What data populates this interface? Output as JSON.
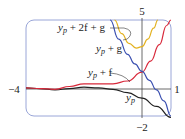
{
  "chart_data": {
    "type": "line",
    "title": "",
    "xlabel": "",
    "ylabel": "",
    "xlim": [
      -4,
      1
    ],
    "ylim": [
      -2,
      5
    ],
    "tick_labels": {
      "top": "5",
      "bottom": "−2",
      "left": "−4",
      "right": "1"
    },
    "grid": false,
    "series": [
      {
        "name": "y_p",
        "color": "#222222",
        "x": [
          -4,
          -3.5,
          -3,
          -2.5,
          -2,
          -1.5,
          -1,
          -0.5,
          0,
          0.5,
          1
        ],
        "y": [
          0.05,
          0.0,
          -0.1,
          0.0,
          0.1,
          0.05,
          -0.05,
          -0.3,
          -0.7,
          -1.3,
          -2.1
        ]
      },
      {
        "name": "y_p + f",
        "color": "#d8283a",
        "x": [
          -4,
          -3.5,
          -3,
          -2.5,
          -2,
          -1.5,
          -1,
          -0.5,
          0,
          0.3,
          0.6,
          0.85,
          1
        ],
        "y": [
          0.05,
          0.0,
          -0.05,
          0.15,
          0.35,
          0.35,
          0.35,
          0.55,
          1.2,
          2.0,
          3.2,
          4.6,
          5.0
        ]
      },
      {
        "name": "y_p + g",
        "color": "#3a4fb0",
        "x": [
          -1.1,
          -0.8,
          -0.5,
          -0.25,
          0,
          0.25,
          0.5,
          0.75,
          1
        ],
        "y": [
          5.0,
          3.6,
          2.5,
          1.8,
          1.25,
          0.6,
          -0.1,
          -0.9,
          -2.0
        ]
      },
      {
        "name": "y_p + 2f + g",
        "color": "#e3b11f",
        "x": [
          -0.95,
          -0.7,
          -0.45,
          -0.2,
          0,
          0.2,
          0.4,
          0.55
        ],
        "y": [
          5.0,
          4.0,
          3.3,
          2.95,
          3.05,
          3.6,
          4.4,
          5.0
        ]
      }
    ],
    "annotations": [
      "y_p + 2f + g",
      "y_p + g",
      "y_p + f",
      "y_p"
    ]
  },
  "labels": {
    "yp2fg": "y",
    "yp2fg_sub": "p",
    "yp2fg_rest": " + 2f + g",
    "ypg": "y",
    "ypg_sub": "p",
    "ypg_rest": " + g",
    "ypf": "y",
    "ypf_sub": "p",
    "ypf_rest": " + f",
    "yp": "y",
    "yp_sub": "p"
  },
  "ticks": {
    "top": "5",
    "bottom": "−2",
    "left": "−4",
    "right": "1"
  },
  "colors": {
    "frame": "#9aa6d8",
    "axis": "#444444",
    "yp": "#222222",
    "ypf": "#d8283a",
    "ypg": "#3a4fb0",
    "yp2fg": "#e3b11f"
  }
}
